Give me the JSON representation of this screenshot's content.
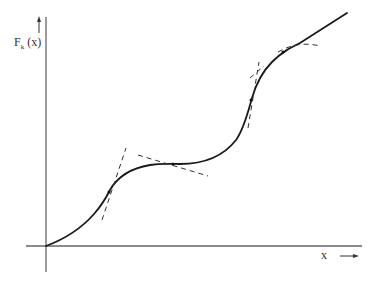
{
  "figure": {
    "type": "function-plot-schematic",
    "y_axis_label": {
      "main": "F",
      "subscript": "k",
      "argument": "(x)"
    },
    "x_axis_label": "x",
    "colors": {
      "background": "#ffffff",
      "axes": "#555555",
      "curve": "#222222",
      "tangents": "#444444"
    },
    "elements": [
      "y-axis with upward arrow",
      "x-axis with rightward arrow",
      "solid S-shaped staircase curve starting at origin",
      "dashed tangent lines at inflection and flat points"
    ]
  }
}
